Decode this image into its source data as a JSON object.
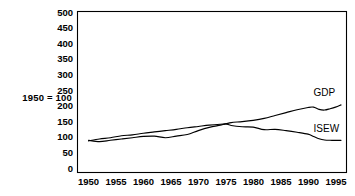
{
  "chart_data": {
    "type": "line",
    "title": "",
    "subtitle": "",
    "xlabel": "",
    "ylabel": "1950 = 100",
    "axis_note": "1950 = 100",
    "xlim": [
      1948,
      1997
    ],
    "ylim": [
      0,
      500
    ],
    "grid": false,
    "legend_position": "inline-right",
    "x_ticks": [
      "1950",
      "1955",
      "1960",
      "1965",
      "1970",
      "1975",
      "1980",
      "1985",
      "1990",
      "1995"
    ],
    "x_tick_values": [
      1950,
      1955,
      1960,
      1965,
      1970,
      1975,
      1980,
      1985,
      1990,
      1995
    ],
    "y_ticks": [
      "0",
      "50",
      "100",
      "150",
      "200",
      "250",
      "300",
      "350",
      "400",
      "450",
      "500"
    ],
    "y_tick_values": [
      0,
      50,
      100,
      150,
      200,
      250,
      300,
      350,
      400,
      450,
      500
    ],
    "x": [
      1950,
      1952,
      1954,
      1956,
      1958,
      1960,
      1962,
      1964,
      1966,
      1968,
      1970,
      1972,
      1974,
      1975,
      1976,
      1978,
      1980,
      1982,
      1984,
      1986,
      1988,
      1990,
      1991,
      1992,
      1993,
      1994,
      1995,
      1996
    ],
    "series": [
      {
        "name": "GDP",
        "label": "GDP",
        "color": "#000000",
        "values": [
          98,
          104,
          108,
          114,
          117,
          122,
          126,
          130,
          134,
          139,
          143,
          147,
          150,
          151,
          155,
          158,
          162,
          168,
          177,
          186,
          195,
          202,
          203,
          196,
          194,
          198,
          203,
          210
        ]
      },
      {
        "name": "ISEW",
        "label": "ISEW",
        "color": "#000000",
        "values": [
          100,
          96,
          100,
          104,
          108,
          112,
          113,
          108,
          113,
          118,
          130,
          140,
          147,
          151,
          146,
          142,
          141,
          133,
          134,
          130,
          125,
          119,
          112,
          105,
          101,
          100,
          100,
          100
        ]
      }
    ],
    "annotations": [
      {
        "text": "GDP",
        "x": 1991,
        "y": 238
      },
      {
        "text": "ISEW",
        "x": 1991,
        "y": 127
      }
    ]
  }
}
